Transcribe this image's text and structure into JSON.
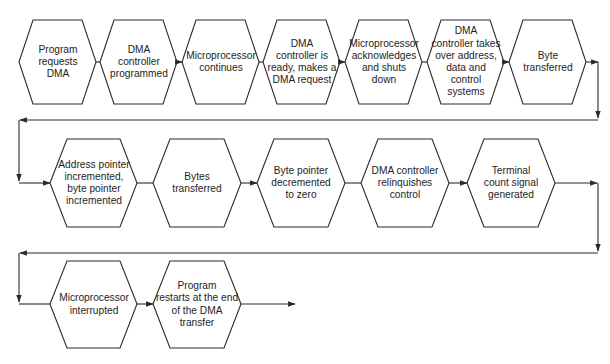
{
  "diagram": {
    "colors": {
      "stroke": "#2b2b2b",
      "text": "#1e1e1e",
      "background": "#ffffff"
    },
    "rows": [
      {
        "steps": [
          {
            "id": "s1",
            "label": "Program\nrequests\nDMA"
          },
          {
            "id": "s2",
            "label": "DMA\ncontroller\nprogrammed"
          },
          {
            "id": "s3",
            "label": "Microprocessor\ncontinues"
          },
          {
            "id": "s4",
            "label": "DMA\ncontroller is\nready, makes a\nDMA request"
          },
          {
            "id": "s5",
            "label": "Microprocessor\nacknowledges\nand shuts\ndown"
          },
          {
            "id": "s6",
            "label": "DMA\ncontroller takes\nover address,\ndata and\ncontrol\nsystems"
          },
          {
            "id": "s7",
            "label": "Byte\ntransferred"
          }
        ]
      },
      {
        "steps": [
          {
            "id": "s8",
            "label": "Address pointer\nincremented,\nbyte pointer\nincremented"
          },
          {
            "id": "s9",
            "label": "Bytes\ntransferred"
          },
          {
            "id": "s10",
            "label": "Byte pointer\ndecremented\nto zero"
          },
          {
            "id": "s11",
            "label": "DMA controller\nrelinquishes\ncontrol"
          },
          {
            "id": "s12",
            "label": "Terminal\ncount signal\ngenerated"
          }
        ]
      },
      {
        "steps": [
          {
            "id": "s13",
            "label": "Microprocessor\ninterrupted"
          },
          {
            "id": "s14",
            "label": "Program\nrestarts at the end\nof the DMA\ntransfer"
          }
        ]
      }
    ]
  }
}
